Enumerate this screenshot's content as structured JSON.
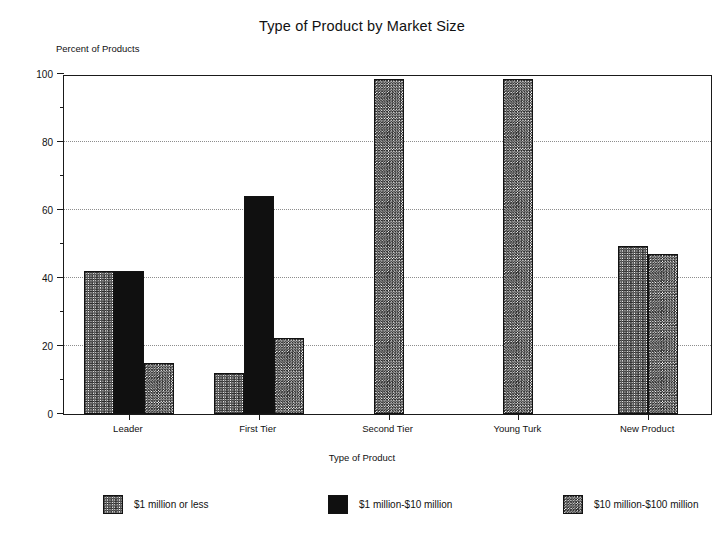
{
  "chart_data": {
    "type": "bar",
    "title": "Type of Product by Market Size",
    "xlabel": "Type of Product",
    "ylabel": "Percent of Products",
    "categories": [
      "Leader",
      "First Tier",
      "Second Tier",
      "Young Turk",
      "New Product"
    ],
    "series": [
      {
        "name": "$1 million or less",
        "pattern": "crosshatch",
        "values": [
          42,
          12,
          null,
          null,
          49.5
        ]
      },
      {
        "name": "$1 million-$10 million",
        "pattern": "solid",
        "values": [
          42,
          64,
          null,
          null,
          null
        ]
      },
      {
        "name": "$10 million-$100 million",
        "pattern": "diagonal",
        "values": [
          15,
          22.5,
          98.5,
          98.5,
          47
        ]
      }
    ],
    "ylim": [
      0,
      100
    ],
    "ytick_labels": [
      "0",
      "20",
      "40",
      "60",
      "80",
      "100"
    ],
    "ytick_values": [
      0,
      20,
      40,
      60,
      80,
      100
    ],
    "yminor_values": [
      10,
      30,
      50,
      70,
      90
    ],
    "gridlines": [
      20,
      40,
      60,
      80
    ],
    "grid": true,
    "legend_position": "bottom"
  },
  "legend": {
    "items": [
      {
        "label": "$1 million or less"
      },
      {
        "label": "$1 million-$10 million"
      },
      {
        "label": "$10 million-$100 million"
      }
    ]
  }
}
